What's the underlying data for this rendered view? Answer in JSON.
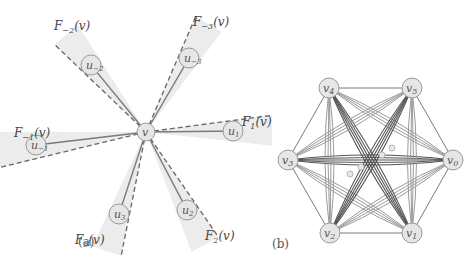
{
  "panel_a": {
    "caption": "(a)",
    "center": {
      "label": "v",
      "x": 146,
      "y": 132
    },
    "neighbors": [
      {
        "label": "u1",
        "display": "u",
        "sub": "1",
        "x": 233,
        "y": 131,
        "cone_label": "F",
        "cone_sub": "1",
        "cone_arg": "(v)",
        "lx": 242,
        "ly": 126
      },
      {
        "label": "u2",
        "display": "u",
        "sub": "2",
        "x": 187,
        "y": 210,
        "cone_label": "F",
        "cone_sub": "2",
        "cone_arg": "(v)",
        "lx": 205,
        "ly": 240
      },
      {
        "label": "u3",
        "display": "u",
        "sub": "3",
        "x": 119,
        "y": 214,
        "cone_label": "F",
        "cone_sub": "3",
        "cone_arg": "(v)",
        "lx": 75,
        "ly": 244
      },
      {
        "label": "u-1",
        "display": "u",
        "sub": "−1",
        "x": 36,
        "y": 145,
        "cone_label": "F",
        "cone_sub": "−1",
        "cone_arg": "(v)",
        "lx": 14,
        "ly": 137
      },
      {
        "label": "u-2",
        "display": "u",
        "sub": "−2",
        "x": 91,
        "y": 65,
        "cone_label": "F",
        "cone_sub": "−2",
        "cone_arg": "(v)",
        "lx": 54,
        "ly": 30
      },
      {
        "label": "u-3",
        "display": "u",
        "sub": "−3",
        "x": 189,
        "y": 58,
        "cone_label": "F",
        "cone_sub": "−3",
        "cone_arg": "(v)",
        "lx": 193,
        "ly": 26
      }
    ]
  },
  "panel_b": {
    "caption": "(b)",
    "vertices": [
      {
        "label": "v0",
        "sub": "0",
        "x": 453,
        "y": 160
      },
      {
        "label": "v1",
        "sub": "1",
        "x": 412,
        "y": 233
      },
      {
        "label": "v2",
        "sub": "2",
        "x": 330,
        "y": 233
      },
      {
        "label": "v3",
        "sub": "3",
        "x": 288,
        "y": 160
      },
      {
        "label": "v4",
        "sub": "4",
        "x": 329,
        "y": 88
      },
      {
        "label": "v5",
        "sub": "5",
        "x": 412,
        "y": 88
      }
    ],
    "inner_nodes": [
      {
        "x": 392,
        "y": 148
      },
      {
        "x": 382,
        "y": 155
      },
      {
        "x": 361,
        "y": 167
      },
      {
        "x": 350,
        "y": 174
      }
    ]
  },
  "colors": {
    "edge": "#7a7a7a",
    "edge_dark": "#555555",
    "edge_light": "#9a9a9a",
    "cone_fill": "#ececec",
    "node_fill": "#e6e6e6",
    "node_stroke": "#9a9a9a",
    "text": "#444444"
  }
}
